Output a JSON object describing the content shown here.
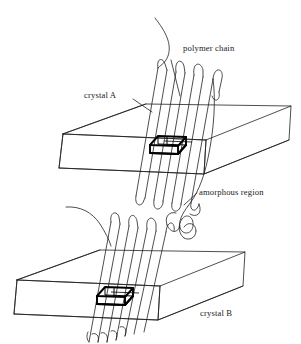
{
  "figure": {
    "background_color": "#ffffff",
    "line_color": "#231f20",
    "unit_cell_color": "#000000",
    "style": "black-and-white line drawing"
  },
  "labels": {
    "polymer_chain": "polymer chain",
    "crystal_a": "crystal A",
    "amorphous_region": "amorphous region",
    "crystal_b": "crystal B"
  },
  "components": {
    "lamella_a": {
      "name": "crystal A",
      "shape": "thin parallelepiped slab (lamella) drawn in oblique projection"
    },
    "lamella_b": {
      "name": "crystal B",
      "shape": "thin parallelepiped slab (lamella) drawn in oblique projection"
    },
    "unit_cell_a": {
      "name": "unit cell in crystal A",
      "shape": "small bold parallelepiped box with internal edges"
    },
    "unit_cell_b": {
      "name": "unit cell in crystal B",
      "shape": "small bold parallelepiped box with internal edges"
    },
    "chain_folds_a_top": {
      "count": 5,
      "shape": "hairpin chain folds emerging from top surface"
    },
    "chain_folds_a_bottom": {
      "count": 5,
      "shape": "hairpin chain folds emerging from bottom surface"
    },
    "chain_folds_b_top": {
      "count": 5,
      "shape": "hairpin chain folds emerging from top surface"
    },
    "chain_folds_b_bottom": {
      "count": 4,
      "shape": "hairpin chain folds emerging from bottom surface"
    },
    "tie_chain": {
      "name": "tie molecule",
      "shape": "chain segment traversing the amorphous region between crystal A and crystal B"
    },
    "free_chain_end_top": {
      "shape": "chain end curving away above crystal A"
    },
    "free_chain_end_left": {
      "shape": "chain end curving away left of crystal B"
    }
  }
}
